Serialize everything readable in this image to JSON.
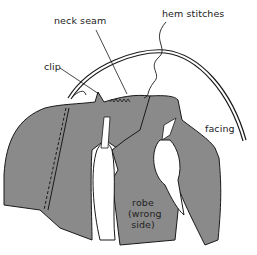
{
  "figure": {
    "colors": {
      "fabric": "#8a8a8a",
      "outline": "#1a1a1a",
      "background": "#ffffff"
    }
  },
  "labels": {
    "neck_seam": "neck seam",
    "hem_stitches": "hem stitches",
    "clip": "clip",
    "facing": "facing",
    "robe_line1": "robe",
    "robe_line2": "(wrong",
    "robe_line3": "side)"
  }
}
